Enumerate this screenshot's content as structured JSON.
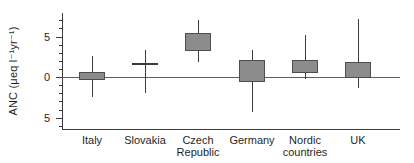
{
  "chart_data": {
    "type": "boxplot",
    "title": "",
    "xlabel": "",
    "ylabel": "ANC (μeq l⁻¹yr⁻¹)",
    "ylim": [
      -6.4,
      7.9
    ],
    "y_major_ticks": [
      {
        "value": 5,
        "label": "5"
      },
      {
        "value": 0,
        "label": "0"
      },
      {
        "value": -5,
        "label": "5"
      }
    ],
    "y_minor_tick_step": 1,
    "zero_line": true,
    "grid": false,
    "legend": false,
    "categories": [
      "Italy",
      "Slovakia",
      "Czech Republic",
      "Germany",
      "Nordic countries",
      "UK"
    ],
    "series": [
      {
        "category": "Italy",
        "box_low": -0.3,
        "box_high": 0.6,
        "median": null,
        "whisker_low": -2.5,
        "whisker_high": 2.6
      },
      {
        "category": "Slovakia",
        "box_low": null,
        "box_high": null,
        "median": 1.6,
        "whisker_low": -2.0,
        "whisker_high": 3.4
      },
      {
        "category": "Czech Republic",
        "box_low": 3.2,
        "box_high": 5.4,
        "median": null,
        "whisker_low": 1.8,
        "whisker_high": 7.0
      },
      {
        "category": "Germany",
        "box_low": -0.6,
        "box_high": 2.1,
        "median": null,
        "whisker_low": -4.3,
        "whisker_high": 3.4
      },
      {
        "category": "Nordic countries",
        "box_low": 0.5,
        "box_high": 2.1,
        "median": null,
        "whisker_low": -0.2,
        "whisker_high": 5.2
      },
      {
        "category": "UK",
        "box_low": -0.1,
        "box_high": 1.8,
        "median": null,
        "whisker_low": -1.4,
        "whisker_high": 7.2
      }
    ],
    "colors": {
      "box_fill": "#8c8c8c",
      "box_border": "#4d4d4d",
      "line": "#3c3c3c",
      "zero_line": "#5e5e5e",
      "text": "#1f1f1f",
      "background": "#ffffff"
    }
  }
}
